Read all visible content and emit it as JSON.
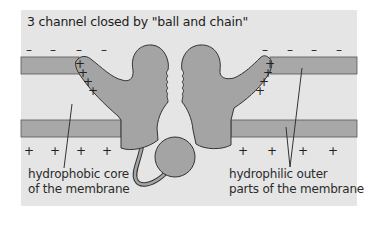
{
  "figure": {
    "title": "3  channel closed by \"ball and chain\"",
    "charges": {
      "top": [
        "–",
        "–",
        "–",
        "–",
        "–",
        "–",
        "–",
        "–"
      ],
      "bottom": [
        "+",
        "+",
        "+",
        "+",
        "+",
        "+",
        "+",
        "+"
      ],
      "voltage_sensor_left": [
        "+",
        "+",
        "+",
        "+"
      ],
      "voltage_sensor_right": [
        "+",
        "+",
        "+",
        "+"
      ]
    },
    "labels": {
      "core_line1": "hydrophobic core",
      "core_line2": "of the membrane",
      "outer_line1": "hydrophilic outer",
      "outer_line2": "parts of the membrane"
    },
    "colors": {
      "background": "#e5e5e5",
      "membrane_band": "#a8a8a8",
      "protein": "#a4a4a4",
      "outline": "#333333"
    }
  }
}
